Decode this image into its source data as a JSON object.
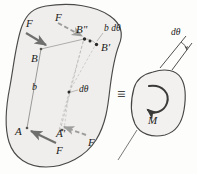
{
  "figure": {
    "type": "mechanics-free-body-diagram",
    "colors": {
      "body_fill": "#efeeec",
      "body_stroke": "#4a4a48",
      "solid_arrow": "#6f6f6d",
      "dashed_arrow": "#9a9a98",
      "construction_line": "#b3b3b1",
      "text": "#1a1a1a",
      "background": "#fdfdfc"
    },
    "left_body": {
      "name": "rigid-body-with-couple",
      "points": [
        {
          "id": "A",
          "label": "A",
          "x": 22,
          "y": 130
        },
        {
          "id": "Ap",
          "label": "A'",
          "x": 58,
          "y": 133
        },
        {
          "id": "B",
          "label": "B",
          "x": 38,
          "y": 52
        },
        {
          "id": "Bpp",
          "label": "B\"",
          "x": 82,
          "y": 31
        },
        {
          "id": "Bp",
          "label": "B'",
          "x": 102,
          "y": 47
        },
        {
          "id": "pivot",
          "label": "",
          "x": 69,
          "y": 92
        }
      ],
      "forces": [
        {
          "id": "F-top-left",
          "label": "F",
          "style": "solid",
          "lx": 26,
          "ly": 24
        },
        {
          "id": "F-top-right",
          "label": "F",
          "style": "dashed",
          "lx": 54,
          "ly": 18
        },
        {
          "id": "F-bottom-left",
          "label": "F",
          "style": "solid",
          "lx": 56,
          "ly": 148
        },
        {
          "id": "F-bottom-right",
          "label": "F",
          "style": "dashed",
          "lx": 86,
          "ly": 140
        }
      ],
      "annotations": [
        {
          "id": "moment-arm",
          "label": "b",
          "x": 34,
          "y": 87
        },
        {
          "id": "arc-length",
          "label": "b dθ",
          "x": 106,
          "y": 28
        },
        {
          "id": "angle-inner",
          "label": "dθ",
          "x": 80,
          "y": 89
        }
      ]
    },
    "equivalence_symbol": {
      "label": "≡",
      "x": 117,
      "y": 85
    },
    "right_body": {
      "name": "rigid-body-with-moment",
      "moment_label": "M",
      "moment_label_x": 150,
      "moment_label_y": 118,
      "rotation_sense": "counterclockwise",
      "annotations": [
        {
          "id": "angle-outer",
          "label": "dθ",
          "x": 173,
          "y": 33
        }
      ]
    }
  }
}
